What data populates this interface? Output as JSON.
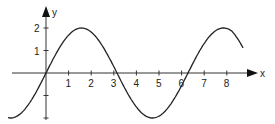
{
  "chart_data": {
    "type": "line",
    "title": "",
    "xlabel": "x",
    "ylabel": "y",
    "x_ticks": [
      "1",
      "2",
      "3",
      "4",
      "5",
      "6",
      "7",
      "8"
    ],
    "y_ticks": [
      "1",
      "2"
    ],
    "xlim": [
      -1.7,
      9.5
    ],
    "ylim": [
      -2,
      2.3
    ],
    "grid": false,
    "series": [
      {
        "name": "curve",
        "function": "2*sin(x)",
        "x": [
          -1.7,
          -1,
          0,
          1,
          1.57,
          2,
          3,
          3.14,
          4,
          4.71,
          5,
          6,
          6.28,
          7,
          7.85,
          8.5
        ],
        "y": [
          -1.98,
          -1.68,
          0,
          1.68,
          2,
          1.82,
          0.28,
          0,
          -1.51,
          -2,
          -1.92,
          -0.56,
          0,
          1.31,
          2,
          1.6
        ]
      }
    ]
  }
}
